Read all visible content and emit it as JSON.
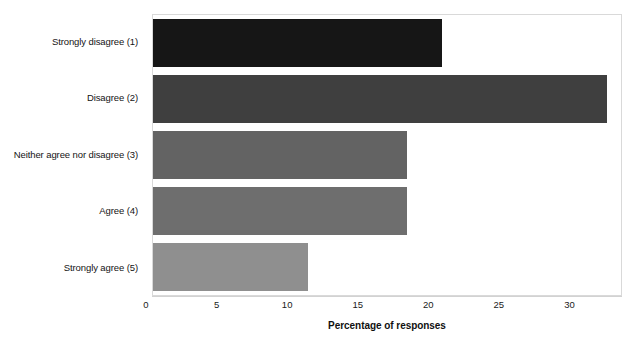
{
  "chart_data": {
    "type": "bar",
    "orientation": "horizontal",
    "title": "",
    "xlabel": "Percentage of responses",
    "ylabel": "",
    "categories": [
      "Strongly disagree (1)",
      "Disagree (2)",
      "Neither agree nor disagree (3)",
      "Agree (4)",
      "Strongly agree (5)"
    ],
    "values": [
      20.5,
      32.2,
      18.0,
      18.0,
      11.0
    ],
    "bar_colors": [
      "#161616",
      "#3f3f3f",
      "#636363",
      "#6e6e6e",
      "#8f8f8f"
    ],
    "xlim": [
      0,
      33.3
    ],
    "xticks": [
      0,
      5,
      10,
      15,
      20,
      25,
      30
    ],
    "xtick_labels": [
      "0",
      "5",
      "10",
      "15",
      "20",
      "25",
      "30"
    ],
    "grid": false,
    "legend": false,
    "plot_border_color": "#d9d9d9",
    "background_color": "#ffffff"
  }
}
